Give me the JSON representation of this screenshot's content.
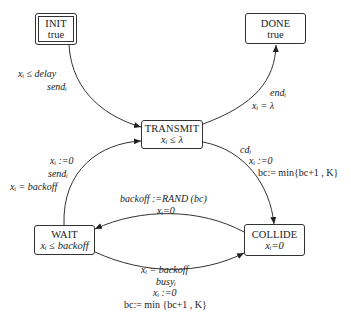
{
  "nodes": {
    "init": {
      "name": "INIT",
      "invariant": "true"
    },
    "done": {
      "name": "DONE",
      "invariant": "true"
    },
    "transmit": {
      "name": "TRANSMIT",
      "invariant": "xᵢ ≤ λ"
    },
    "wait": {
      "name": "WAIT",
      "invariant": "xᵢ ≤ backoff"
    },
    "collide": {
      "name": "COLLIDE",
      "invariant": "xᵢ=0"
    }
  },
  "edges": {
    "init_to_transmit": {
      "guard": "xᵢ ≤ delay",
      "action": "sendᵢ"
    },
    "transmit_to_done": {
      "action": "endᵢ",
      "guard": "xᵢ = λ"
    },
    "transmit_to_collide": {
      "action": "cdᵢ",
      "reset": "xᵢ :=0",
      "update": "bc:= min{bc+1 , K}"
    },
    "wait_to_transmit": {
      "reset": "xᵢ :=0",
      "action": "sendᵢ",
      "guard": "xᵢ = backoff"
    },
    "collide_to_wait": {
      "update": "backoff :=RAND (bc)",
      "reset": "xᵢ=0"
    },
    "wait_to_collide": {
      "guard": "xᵢ = backoff",
      "action": "busyᵢ",
      "reset": "xᵢ :=0",
      "update": "bc:= min {bc+1 , K}"
    }
  }
}
